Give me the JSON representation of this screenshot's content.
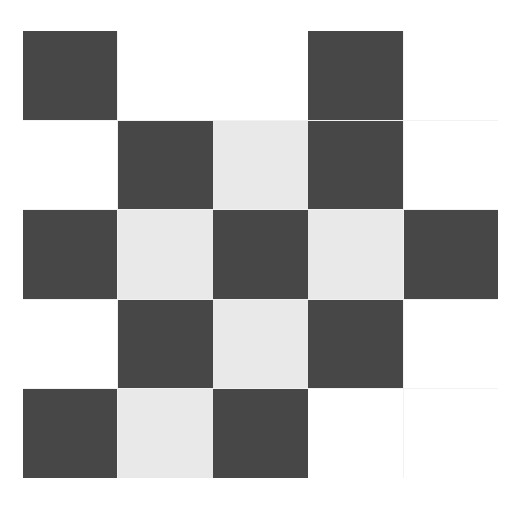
{
  "figure": {
    "background_color": "#ffffff",
    "grid_line_color": "#f2f2f2"
  },
  "palette": {
    "dark": "#474747",
    "light": "#e9e9e9",
    "white": "#ffffff"
  },
  "chart_data": {
    "type": "heatmap",
    "title": "",
    "subtitle": "",
    "xlabel": "",
    "ylabel": "",
    "rows": 5,
    "cols": 5,
    "grid": true,
    "legend": "none",
    "categories": [
      "1",
      "2",
      "3",
      "4",
      "5"
    ],
    "row_labels": [
      "1",
      "2",
      "3",
      "4",
      "5"
    ],
    "col_labels": [
      "1",
      "2",
      "3",
      "4",
      "5"
    ],
    "xticklabels": [],
    "yticklabels": [],
    "value_map": {
      "dark": 0,
      "light": 0.85,
      "white": 1
    },
    "color_map": {
      "0": "#474747",
      "0.85": "#e9e9e9",
      "1": "#ffffff"
    },
    "cells": [
      [
        "dark",
        "white",
        "white",
        "dark",
        "white"
      ],
      [
        "white",
        "dark",
        "light",
        "dark",
        "white"
      ],
      [
        "dark",
        "light",
        "dark",
        "light",
        "dark"
      ],
      [
        "white",
        "dark",
        "light",
        "dark",
        "white"
      ],
      [
        "dark",
        "light",
        "dark",
        "white",
        "white"
      ]
    ],
    "values": [
      [
        0,
        1,
        1,
        0,
        1
      ],
      [
        1,
        0,
        0.85,
        0,
        1
      ],
      [
        0,
        0.85,
        0,
        0.85,
        0
      ],
      [
        1,
        0,
        0.85,
        0,
        1
      ],
      [
        0,
        0.85,
        0,
        1,
        1
      ]
    ],
    "annotations": []
  }
}
